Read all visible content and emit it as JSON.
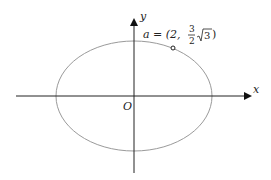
{
  "diagram": {
    "type": "ellipse-on-axes",
    "axes": {
      "x_label": "x",
      "y_label": "y",
      "origin_label": "O"
    },
    "point": {
      "label_prefix": "a = (2,",
      "frac_num": "3",
      "frac_den": "2",
      "sqrt_arg": "3",
      "label_suffix": ")",
      "full_label": "a = (2, 3/2 √3)"
    },
    "colors": {
      "axis": "#222222",
      "ellipse": "#9a9a9a",
      "text": "#222222"
    }
  }
}
